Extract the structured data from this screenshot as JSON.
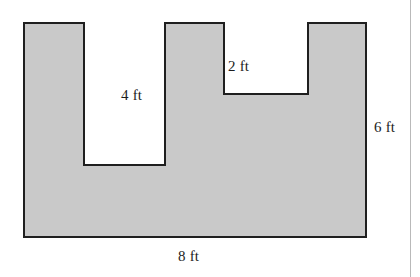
{
  "figure": {
    "kind": "composite-polygon-area-diagram",
    "colors": {
      "fill": "#c9c9c9",
      "stroke": "#1f1f1f",
      "text": "#1c1c1c",
      "background": "#ffffff",
      "page_rule": "#b9b9b9"
    },
    "stroke_width": 2,
    "labels": {
      "notch_left_depth": "4 ft",
      "notch_right_depth": "2 ft",
      "overall_height": "6 ft",
      "overall_width": "8 ft"
    }
  },
  "chart_data": {
    "type": "diagram",
    "title": "",
    "units": "ft",
    "shape": "rectilinear-polygon",
    "overall": {
      "width_ft": 8,
      "height_ft": 6
    },
    "notches": [
      {
        "name": "left-notch",
        "depth_ft": 4,
        "label": "4 ft",
        "position": "top"
      },
      {
        "name": "right-notch",
        "depth_ft": 2,
        "label": "2 ft",
        "position": "top"
      }
    ],
    "vertices_px": [
      [
        24,
        23
      ],
      [
        84,
        23
      ],
      [
        84,
        165
      ],
      [
        165,
        165
      ],
      [
        165,
        23
      ],
      [
        224,
        23
      ],
      [
        224,
        94
      ],
      [
        308,
        94
      ],
      [
        308,
        23
      ],
      [
        366,
        23
      ],
      [
        366,
        237
      ],
      [
        24,
        237
      ]
    ],
    "annotations": [
      {
        "text": "4 ft",
        "x_px": 140,
        "y_px": 96,
        "refers_to": "left-notch depth"
      },
      {
        "text": "2 ft",
        "x_px": 248,
        "y_px": 67,
        "refers_to": "right-notch depth"
      },
      {
        "text": "6 ft",
        "x_px": 389,
        "y_px": 128,
        "refers_to": "overall height"
      },
      {
        "text": "8 ft",
        "x_px": 195,
        "y_px": 257,
        "refers_to": "overall width"
      }
    ]
  }
}
